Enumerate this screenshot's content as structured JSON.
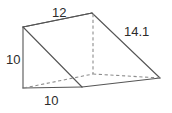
{
  "figure": {
    "name": "triangular-prism-diagram",
    "shape_type": "triangular prism",
    "stroke_color": "#555555",
    "hidden_stroke_color": "#8d8d8d",
    "background_color": "#ffffff",
    "text_color": "#2b2b2b",
    "labels": {
      "top_edge": "12",
      "slant_edge": "14.1",
      "left_height": "10",
      "bottom_edge": "10"
    },
    "vertices": {
      "top_back_left": [
        23,
        27
      ],
      "top_back_right": [
        92,
        13
      ],
      "bottom_front_left": [
        23,
        88
      ],
      "bottom_front_mid": [
        82,
        87
      ],
      "right_apex": [
        160,
        78
      ],
      "hidden_back_bottom": [
        93,
        74
      ]
    }
  }
}
